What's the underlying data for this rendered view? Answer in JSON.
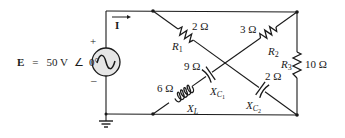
{
  "source": {
    "symbol": "E",
    "equals": "=",
    "value": "50 V",
    "angle_symbol": "∠",
    "angle": "0°",
    "plus": "+",
    "minus": "–"
  },
  "current": {
    "label": "I"
  },
  "components": {
    "R1": {
      "name": "R",
      "sub": "1",
      "value": "2 Ω"
    },
    "R2": {
      "name": "R",
      "sub": "2",
      "value": "3 Ω"
    },
    "R3": {
      "name": "R",
      "sub": "3",
      "value": "10 Ω"
    },
    "XC1": {
      "name": "X",
      "sub": "C",
      "subsub": "1",
      "value": "9 Ω"
    },
    "XC2": {
      "name": "X",
      "sub": "C",
      "subsub": "2",
      "value": "2 Ω"
    },
    "XL": {
      "name": "X",
      "sub": "L",
      "value": "6 Ω"
    }
  }
}
